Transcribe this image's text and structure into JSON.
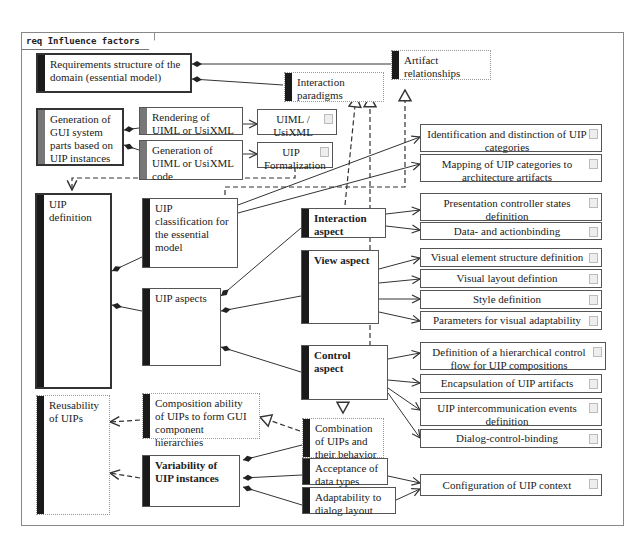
{
  "frame": {
    "label": "req Influence factors"
  },
  "nodes": {
    "requirements_structure": "Requirements structure of the domain (essential model)",
    "interaction_paradigms": "Interaction paradigms",
    "artifact_relationships": "Artifact relationships",
    "generation_gui": "Generation of GUI system parts based on UIP instances",
    "rendering_uiml": "Rendering of UIML or UsiXML code",
    "generation_uiml": "Generation of UIML or UsiXML code",
    "render_tools": "UIML / UsiXML render tools",
    "uip_formalization": "UIP Formalization",
    "identification": "Identification and distinction of UIP categories",
    "mapping": "Mapping of UIP categories to architecture artifacts",
    "uip_definition": "UIP definition",
    "uip_classification": "UIP classification for the essential model",
    "interaction_aspect": "Interaction aspect",
    "presentation_controller": "Presentation controller states definition",
    "data_actionbinding": "Data- and actionbinding",
    "view_aspect": "View aspect",
    "visual_element": "Visual element structure definition",
    "visual_layout": "Visual layout defintion",
    "style_definition": "Style definition",
    "parameters_visual": "Parameters for visual adaptability",
    "uip_aspects": "UIP aspects",
    "control_aspect": "Control aspect",
    "hierarchical_control": "Definition of a hierarchical control flow for UIP compositions",
    "encapsulation": "Encapsulation of UIP artifacts",
    "intercommunication": "UIP intercommunication events definition",
    "dialog_control": "Dialog-control-binding",
    "reusability": "Reusability of UIPs",
    "composition_ability": "Composition ability of UIPs to form GUI component hierarchies",
    "combination": "Combination of UIPs and their behavior",
    "variability": "Variability of UIP instances",
    "acceptance": "Acceptance of data types",
    "adaptability": "Adaptability to dialog layout",
    "configuration": "Configuration of UIP context"
  }
}
